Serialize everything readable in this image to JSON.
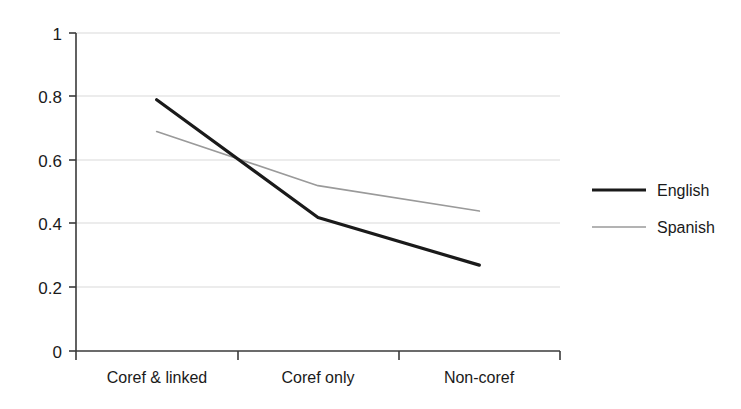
{
  "chart_data": {
    "type": "line",
    "title": "",
    "xlabel": "",
    "ylabel": "",
    "categories": [
      "Coref & linked",
      "Coref only",
      "Non-coref"
    ],
    "series": [
      {
        "name": "English",
        "values": [
          0.79,
          0.42,
          0.27
        ],
        "color": "#1a1a1a",
        "width": 3.2
      },
      {
        "name": "Spanish",
        "values": [
          0.69,
          0.52,
          0.44
        ],
        "color": "#9a9a9a",
        "width": 1.6
      }
    ],
    "ylim": [
      0,
      1
    ],
    "yticks": [
      0,
      0.2,
      0.4,
      0.6,
      0.8,
      1
    ],
    "ytick_labels": [
      "0",
      "0.2",
      "0.4",
      "0.6",
      "0.8",
      "1"
    ],
    "grid": true,
    "grid_color": "#d9d9d9",
    "axis_color": "#3a3a3a",
    "legend_position": "right",
    "legend": [
      {
        "label": "English",
        "color": "#1a1a1a",
        "width": 3.2
      },
      {
        "label": "Spanish",
        "color": "#9a9a9a",
        "width": 1.6
      }
    ]
  },
  "axes": {
    "y_ticks": [
      {
        "label": "1"
      },
      {
        "label": "0.8"
      },
      {
        "label": "0.6"
      },
      {
        "label": "0.4"
      },
      {
        "label": "0.2"
      },
      {
        "label": "0"
      }
    ],
    "x_ticks": [
      {
        "label": "Coref & linked"
      },
      {
        "label": "Coref only"
      },
      {
        "label": "Non-coref"
      }
    ]
  },
  "legend": {
    "items": [
      {
        "label": "English"
      },
      {
        "label": "Spanish"
      }
    ]
  }
}
